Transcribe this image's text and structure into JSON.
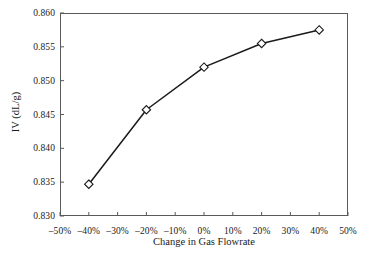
{
  "chart_data": {
    "type": "line",
    "title": "",
    "xlabel": "Change in Gas Flowrate",
    "ylabel": "IV (dL/g)",
    "x": [
      -40,
      -20,
      0,
      20,
      40
    ],
    "values": [
      0.8347,
      0.8457,
      0.852,
      0.8555,
      0.8575
    ],
    "series": [
      {
        "name": "IV",
        "values": [
          0.8347,
          0.8457,
          0.852,
          0.8555,
          0.8575
        ]
      }
    ],
    "xlim": [
      -50,
      50
    ],
    "ylim": [
      0.83,
      0.86
    ],
    "x_tick_labels": [
      "–50%",
      "–40%",
      "–30%",
      "–20%",
      "–10%",
      "0%",
      "10%",
      "20%",
      "30%",
      "40%",
      "50%"
    ],
    "x_tick_values": [
      -50,
      -40,
      -30,
      -20,
      -10,
      0,
      10,
      20,
      30,
      40,
      50
    ],
    "y_tick_labels": [
      "0.830",
      "0.835",
      "0.840",
      "0.845",
      "0.850",
      "0.855",
      "0.860"
    ],
    "y_tick_values": [
      0.83,
      0.835,
      0.84,
      0.845,
      0.85,
      0.855,
      0.86
    ],
    "grid": false,
    "legend": "none",
    "marker": "open-diamond",
    "line_color": "#1a1a1a",
    "marker_fill": "#ffffff",
    "marker_stroke": "#1a1a1a",
    "frame_color": "#5a5a5a"
  }
}
